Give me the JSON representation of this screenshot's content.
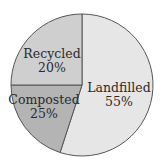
{
  "chart_data": {
    "type": "pie",
    "title": "",
    "slices": [
      {
        "label": "Landfilled",
        "value": 55,
        "value_label": "55%",
        "color": "#e6e6e6",
        "start_deg": 0,
        "end_deg": 198
      },
      {
        "label": "Composted",
        "value": 25,
        "value_label": "25%",
        "color": "#b4b4b4",
        "start_deg": 198,
        "end_deg": 270
      },
      {
        "label": "Recycled",
        "value": 20,
        "value_label": "20%",
        "color": "#cfcfcf",
        "start_deg": 270,
        "end_deg": 360
      }
    ],
    "legend": "none (labels inside slices)"
  }
}
